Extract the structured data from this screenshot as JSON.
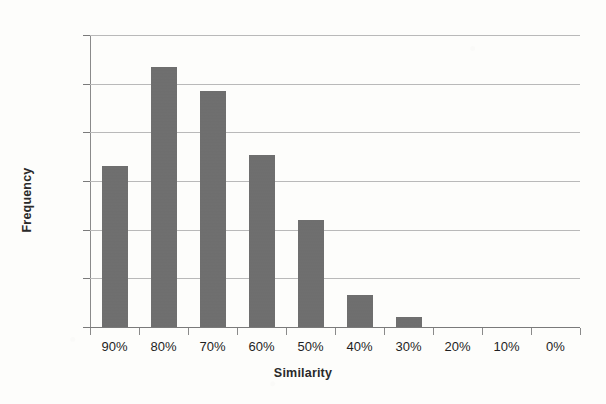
{
  "chart_data": {
    "type": "bar",
    "title": "",
    "xlabel": "Similarity",
    "ylabel": "Frequency",
    "categories": [
      "90%",
      "80%",
      "70%",
      "60%",
      "50%",
      "40%",
      "30%",
      "20%",
      "10%",
      "0%"
    ],
    "values": [
      16.5,
      26.7,
      24.2,
      17.7,
      11.0,
      3.3,
      1.0,
      0.0,
      0.0,
      0.0
    ],
    "value_unit": "%",
    "ylim": [
      0,
      30
    ],
    "ytick_labels": [
      "0%",
      "5%",
      "10%",
      "15%",
      "20%",
      "25%",
      "30%"
    ],
    "ytick_values": [
      0,
      5,
      10,
      15,
      20,
      25,
      30
    ],
    "grid": true,
    "grid_axis": "y",
    "legend": false,
    "legend_position": "none",
    "series": [
      {
        "name": "Frequency",
        "color": "#6e6e6e",
        "values": [
          16.5,
          26.7,
          24.2,
          17.7,
          11.0,
          3.3,
          1.0,
          0.0,
          0.0,
          0.0
        ]
      }
    ]
  },
  "colors": {
    "bar_fill": "#6e6e6e",
    "gridline": "#b9b9b9",
    "axis_line": "#8a8a8a",
    "text": "#1f1f1f",
    "background": "#fdfdfb"
  }
}
